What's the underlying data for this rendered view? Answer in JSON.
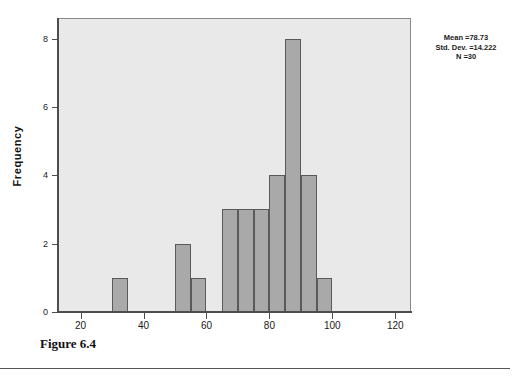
{
  "figure": {
    "caption": "Figure 6.4"
  },
  "annotation": {
    "mean": "Mean =78.73",
    "std_dev": "Std. Dev. =14.222",
    "n": "N =30"
  },
  "colors": {
    "bar_fill": "#a9a9a9",
    "bar_border": "#5a5a5a",
    "plot_background": "#e9e9e9",
    "axis": "#4d4d4d",
    "text": "#1a1a1a"
  },
  "chart_data": {
    "type": "bar",
    "title": "",
    "subtitle": "",
    "xlabel": "",
    "ylabel": "Frequency",
    "xlim": [
      12.5,
      125
    ],
    "ylim": [
      0,
      8.6
    ],
    "grid": false,
    "legend": null,
    "bin_width": 5,
    "x_ticks": [
      20,
      40,
      60,
      80,
      100,
      120
    ],
    "x_tick_labels": [
      "20",
      "40",
      "60",
      "80",
      "100",
      "120"
    ],
    "y_ticks": [
      0,
      2,
      4,
      6,
      8
    ],
    "y_tick_labels": [
      "0",
      "2",
      "4",
      "6",
      "8"
    ],
    "bins": [
      {
        "start": 30,
        "end": 35,
        "value": 1
      },
      {
        "start": 50,
        "end": 55,
        "value": 2
      },
      {
        "start": 55,
        "end": 60,
        "value": 1
      },
      {
        "start": 65,
        "end": 70,
        "value": 3
      },
      {
        "start": 70,
        "end": 75,
        "value": 3
      },
      {
        "start": 75,
        "end": 80,
        "value": 3
      },
      {
        "start": 80,
        "end": 85,
        "value": 4
      },
      {
        "start": 85,
        "end": 90,
        "value": 8
      },
      {
        "start": 90,
        "end": 95,
        "value": 4
      },
      {
        "start": 95,
        "end": 100,
        "value": 1
      }
    ],
    "statistics": {
      "mean": 78.73,
      "std_dev": 14.222,
      "n": 30
    }
  }
}
